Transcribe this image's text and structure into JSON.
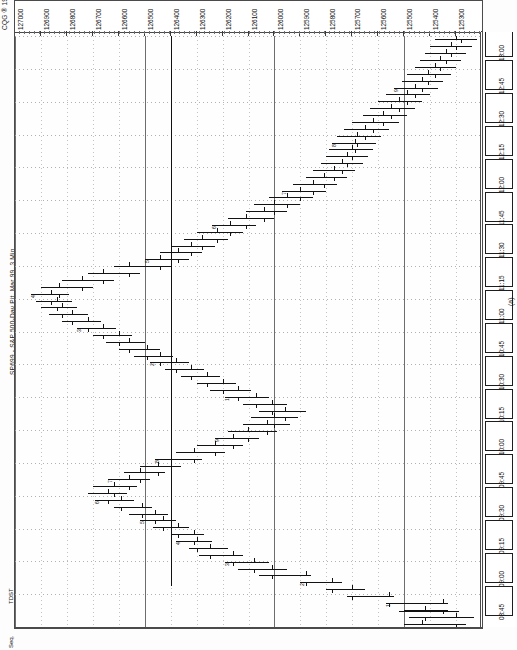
{
  "window": {
    "vendor_tag": "CQG ® 1999",
    "instrument_title": "SP699 - S&P 500-Day Pit, Mar 99, 3 Min",
    "figure_caption": "(a)",
    "tdst_label": "TDST",
    "seq_label": "Seq."
  },
  "chart_data": {
    "type": "ohlc",
    "orientation": "rotated-90",
    "title": "SP699 - S&P 500-Day Pit, Mar 99, 3 Min",
    "xlabel": "Time",
    "ylabel": "Price",
    "grid": true,
    "price_axis": {
      "position": "top",
      "min": 125200,
      "max": 127000,
      "step": 100,
      "ticks": [
        "127000",
        "126900",
        "126800",
        "126700",
        "126600",
        "126500",
        "126400",
        "126300",
        "126200",
        "126100",
        "126000",
        "125900",
        "125800",
        "125700",
        "125600",
        "125500",
        "125400",
        "125300",
        "125200"
      ]
    },
    "time_axis": {
      "position": "right",
      "ticks": [
        "13:00",
        "12:45",
        "12:30",
        "12:15",
        "12:00",
        "11:45",
        "11:30",
        "11:15",
        "11:00",
        "10:45",
        "10:30",
        "10:15",
        "10:00",
        "09:45",
        "09:30",
        "09:15",
        "09:00",
        "08:45"
      ]
    },
    "annotations": {
      "tdst_level": 126400,
      "countdown_digits": [
        "1",
        "2",
        "3",
        "4",
        "5",
        "6",
        "7",
        "8",
        "9",
        "1",
        "2",
        "3",
        "4",
        "5",
        "6",
        "7",
        "8",
        "9"
      ]
    },
    "bars": [
      {
        "t": "08:45",
        "o": 125430,
        "h": 125500,
        "l": 125260,
        "c": 125300
      },
      {
        "t": "08:48",
        "o": 125300,
        "h": 125480,
        "l": 125230,
        "c": 125420
      },
      {
        "t": "08:51",
        "o": 125420,
        "h": 125500,
        "l": 125330,
        "c": 125350
      },
      {
        "t": "08:54",
        "o": 125350,
        "h": 125570,
        "l": 125330,
        "c": 125560
      },
      {
        "t": "08:57",
        "o": 125560,
        "h": 125720,
        "l": 125540,
        "c": 125700
      },
      {
        "t": "09:00",
        "o": 125700,
        "h": 125800,
        "l": 125650,
        "c": 125780
      },
      {
        "t": "09:03",
        "o": 125780,
        "h": 125900,
        "l": 125740,
        "c": 125880
      },
      {
        "t": "09:06",
        "o": 125880,
        "h": 126060,
        "l": 125860,
        "c": 126010
      },
      {
        "t": "09:09",
        "o": 126010,
        "h": 126140,
        "l": 125950,
        "c": 126080
      },
      {
        "t": "09:12",
        "o": 126080,
        "h": 126190,
        "l": 126020,
        "c": 126160
      },
      {
        "t": "09:15",
        "o": 126160,
        "h": 126290,
        "l": 126120,
        "c": 126250
      },
      {
        "t": "09:18",
        "o": 126250,
        "h": 126330,
        "l": 126180,
        "c": 126300
      },
      {
        "t": "09:21",
        "o": 126300,
        "h": 126380,
        "l": 126240,
        "c": 126310
      },
      {
        "t": "09:24",
        "o": 126310,
        "h": 126400,
        "l": 126270,
        "c": 126370
      },
      {
        "t": "09:27",
        "o": 126370,
        "h": 126470,
        "l": 126330,
        "c": 126430
      },
      {
        "t": "09:30",
        "o": 126430,
        "h": 126520,
        "l": 126380,
        "c": 126460
      },
      {
        "t": "09:33",
        "o": 126460,
        "h": 126560,
        "l": 126410,
        "c": 126510
      },
      {
        "t": "09:36",
        "o": 126510,
        "h": 126620,
        "l": 126470,
        "c": 126590
      },
      {
        "t": "09:39",
        "o": 126590,
        "h": 126690,
        "l": 126540,
        "c": 126640
      },
      {
        "t": "09:42",
        "o": 126640,
        "h": 126720,
        "l": 126570,
        "c": 126620
      },
      {
        "t": "09:45",
        "o": 126620,
        "h": 126700,
        "l": 126530,
        "c": 126560
      },
      {
        "t": "09:48",
        "o": 126560,
        "h": 126640,
        "l": 126480,
        "c": 126520
      },
      {
        "t": "09:51",
        "o": 126520,
        "h": 126580,
        "l": 126420,
        "c": 126450
      },
      {
        "t": "09:54",
        "o": 126450,
        "h": 126520,
        "l": 126360,
        "c": 126400
      },
      {
        "t": "09:57",
        "o": 126400,
        "h": 126460,
        "l": 126280,
        "c": 126310
      },
      {
        "t": "10:00",
        "o": 126310,
        "h": 126380,
        "l": 126190,
        "c": 126230
      },
      {
        "t": "10:03",
        "o": 126230,
        "h": 126300,
        "l": 126120,
        "c": 126160
      },
      {
        "t": "10:06",
        "o": 126160,
        "h": 126230,
        "l": 126060,
        "c": 126100
      },
      {
        "t": "10:09",
        "o": 126100,
        "h": 126180,
        "l": 125990,
        "c": 126030
      },
      {
        "t": "10:12",
        "o": 126030,
        "h": 126120,
        "l": 125940,
        "c": 126000
      },
      {
        "t": "10:15",
        "o": 126000,
        "h": 126090,
        "l": 125910,
        "c": 125960
      },
      {
        "t": "10:18",
        "o": 125960,
        "h": 126060,
        "l": 125880,
        "c": 126010
      },
      {
        "t": "10:21",
        "o": 126010,
        "h": 126120,
        "l": 125950,
        "c": 126070
      },
      {
        "t": "10:24",
        "o": 126070,
        "h": 126190,
        "l": 126020,
        "c": 126140
      },
      {
        "t": "10:27",
        "o": 126140,
        "h": 126250,
        "l": 126090,
        "c": 126200
      },
      {
        "t": "10:30",
        "o": 126200,
        "h": 126300,
        "l": 126150,
        "c": 126260
      },
      {
        "t": "10:33",
        "o": 126260,
        "h": 126360,
        "l": 126210,
        "c": 126320
      },
      {
        "t": "10:36",
        "o": 126320,
        "h": 126420,
        "l": 126270,
        "c": 126380
      },
      {
        "t": "10:39",
        "o": 126380,
        "h": 126480,
        "l": 126330,
        "c": 126440
      },
      {
        "t": "10:42",
        "o": 126440,
        "h": 126540,
        "l": 126390,
        "c": 126490
      },
      {
        "t": "10:45",
        "o": 126490,
        "h": 126600,
        "l": 126440,
        "c": 126560
      },
      {
        "t": "10:48",
        "o": 126560,
        "h": 126650,
        "l": 126500,
        "c": 126600
      },
      {
        "t": "10:51",
        "o": 126600,
        "h": 126700,
        "l": 126550,
        "c": 126660
      },
      {
        "t": "10:54",
        "o": 126660,
        "h": 126760,
        "l": 126610,
        "c": 126720
      },
      {
        "t": "10:57",
        "o": 126720,
        "h": 126820,
        "l": 126670,
        "c": 126780
      },
      {
        "t": "11:00",
        "o": 126780,
        "h": 126870,
        "l": 126720,
        "c": 126820
      },
      {
        "t": "11:03",
        "o": 126820,
        "h": 126900,
        "l": 126760,
        "c": 126840
      },
      {
        "t": "11:06",
        "o": 126840,
        "h": 126920,
        "l": 126780,
        "c": 126860
      },
      {
        "t": "11:09",
        "o": 126860,
        "h": 126940,
        "l": 126790,
        "c": 126830
      },
      {
        "t": "11:12",
        "o": 126830,
        "h": 126900,
        "l": 126700,
        "c": 126740
      },
      {
        "t": "11:15",
        "o": 126740,
        "h": 126820,
        "l": 126620,
        "c": 126660
      },
      {
        "t": "11:18",
        "o": 126660,
        "h": 126720,
        "l": 126520,
        "c": 126560
      },
      {
        "t": "11:21",
        "o": 126560,
        "h": 126620,
        "l": 126400,
        "c": 126440
      },
      {
        "t": "11:24",
        "o": 126440,
        "h": 126500,
        "l": 126330,
        "c": 126370
      },
      {
        "t": "11:27",
        "o": 126370,
        "h": 126440,
        "l": 126280,
        "c": 126320
      },
      {
        "t": "11:30",
        "o": 126320,
        "h": 126400,
        "l": 126230,
        "c": 126280
      },
      {
        "t": "11:33",
        "o": 126280,
        "h": 126350,
        "l": 126180,
        "c": 126220
      },
      {
        "t": "11:36",
        "o": 126220,
        "h": 126300,
        "l": 126120,
        "c": 126170
      },
      {
        "t": "11:39",
        "o": 126170,
        "h": 126240,
        "l": 126070,
        "c": 126110
      },
      {
        "t": "11:42",
        "o": 126110,
        "h": 126180,
        "l": 126000,
        "c": 126040
      },
      {
        "t": "11:45",
        "o": 126040,
        "h": 126110,
        "l": 125950,
        "c": 126000
      },
      {
        "t": "11:48",
        "o": 126000,
        "h": 126080,
        "l": 125900,
        "c": 125950
      },
      {
        "t": "11:51",
        "o": 125950,
        "h": 126020,
        "l": 125850,
        "c": 125900
      },
      {
        "t": "11:54",
        "o": 125900,
        "h": 125970,
        "l": 125800,
        "c": 125850
      },
      {
        "t": "11:57",
        "o": 125850,
        "h": 125930,
        "l": 125760,
        "c": 125810
      },
      {
        "t": "12:00",
        "o": 125810,
        "h": 125880,
        "l": 125720,
        "c": 125770
      },
      {
        "t": "12:03",
        "o": 125770,
        "h": 125850,
        "l": 125690,
        "c": 125740
      },
      {
        "t": "12:06",
        "o": 125740,
        "h": 125820,
        "l": 125660,
        "c": 125720
      },
      {
        "t": "12:09",
        "o": 125720,
        "h": 125800,
        "l": 125640,
        "c": 125700
      },
      {
        "t": "12:12",
        "o": 125700,
        "h": 125790,
        "l": 125620,
        "c": 125690
      },
      {
        "t": "12:15",
        "o": 125690,
        "h": 125780,
        "l": 125610,
        "c": 125680
      },
      {
        "t": "12:18",
        "o": 125680,
        "h": 125760,
        "l": 125590,
        "c": 125650
      },
      {
        "t": "12:21",
        "o": 125650,
        "h": 125730,
        "l": 125560,
        "c": 125620
      },
      {
        "t": "12:24",
        "o": 125620,
        "h": 125700,
        "l": 125520,
        "c": 125580
      },
      {
        "t": "12:27",
        "o": 125580,
        "h": 125660,
        "l": 125490,
        "c": 125550
      },
      {
        "t": "12:30",
        "o": 125550,
        "h": 125630,
        "l": 125460,
        "c": 125520
      },
      {
        "t": "12:33",
        "o": 125520,
        "h": 125600,
        "l": 125430,
        "c": 125490
      },
      {
        "t": "12:36",
        "o": 125490,
        "h": 125570,
        "l": 125400,
        "c": 125460
      },
      {
        "t": "12:39",
        "o": 125460,
        "h": 125540,
        "l": 125370,
        "c": 125430
      },
      {
        "t": "12:42",
        "o": 125430,
        "h": 125510,
        "l": 125350,
        "c": 125410
      },
      {
        "t": "12:45",
        "o": 125410,
        "h": 125490,
        "l": 125320,
        "c": 125380
      },
      {
        "t": "12:48",
        "o": 125380,
        "h": 125460,
        "l": 125300,
        "c": 125360
      },
      {
        "t": "12:51",
        "o": 125360,
        "h": 125440,
        "l": 125280,
        "c": 125340
      },
      {
        "t": "12:54",
        "o": 125340,
        "h": 125420,
        "l": 125260,
        "c": 125320
      },
      {
        "t": "12:57",
        "o": 125320,
        "h": 125400,
        "l": 125240,
        "c": 125300
      },
      {
        "t": "13:00",
        "o": 125300,
        "h": 125380,
        "l": 125220,
        "c": 125280
      }
    ]
  }
}
